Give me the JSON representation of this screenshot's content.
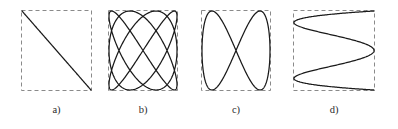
{
  "figure": {
    "title": "",
    "background_color": "#ffffff",
    "curve_color": "#1a1a1a",
    "box_color": "#8a8a8a",
    "label_color": "#2b2b2b",
    "panel_count": 4
  },
  "chart_data": {
    "type": "line",
    "xlabel": "",
    "ylabel": "",
    "grid": false,
    "legend": null,
    "panels": [
      {
        "id": "a",
        "label": "a)",
        "description": "straight diagonal line from top-left to bottom-right",
        "frequency_ratio": "1:1",
        "phase_deg": 180,
        "lobes_horizontal": 1,
        "lobes_vertical": 1,
        "box": {
          "x": 21,
          "y": 10,
          "width": 71,
          "height": 81
        },
        "xlim": [
          -1,
          1
        ],
        "ylim": [
          -1,
          1
        ],
        "param": {
          "a": 1,
          "b": 1,
          "delta_deg": 180,
          "t_range_deg": [
            0,
            360
          ]
        },
        "samples": 400
      },
      {
        "id": "b",
        "label": "b)",
        "description": "woven X-pattern with three rounded lobes on each vertical side",
        "frequency_ratio": "3:4",
        "phase_deg": 90,
        "lobes_horizontal": 4,
        "lobes_vertical": 3,
        "box": {
          "x": 108,
          "y": 10,
          "width": 70,
          "height": 81
        },
        "xlim": [
          -1,
          1
        ],
        "ylim": [
          -1,
          1
        ],
        "param": {
          "a": 3,
          "b": 4,
          "delta_deg": 90,
          "t_range_deg": [
            0,
            360
          ]
        },
        "samples": 800
      },
      {
        "id": "c",
        "label": "c)",
        "description": "two elongated loops crossing once at center, sideways Z shape",
        "frequency_ratio": "1:2",
        "phase_deg": 90,
        "lobes_horizontal": 2,
        "lobes_vertical": 1,
        "box": {
          "x": 201,
          "y": 10,
          "width": 70,
          "height": 81
        },
        "xlim": [
          -1,
          1
        ],
        "ylim": [
          -1,
          1
        ],
        "param": {
          "a": 1,
          "b": 2,
          "delta_deg": 90,
          "t_range_deg": [
            0,
            360
          ]
        },
        "samples": 600
      },
      {
        "id": "d",
        "label": "d)",
        "description": "four tall narrow vertical ellipse lobes side by side",
        "frequency_ratio": "1:4",
        "phase_deg": 90,
        "lobes_horizontal": 4,
        "lobes_vertical": 1,
        "box": {
          "x": 293,
          "y": 10,
          "width": 82,
          "height": 81
        },
        "xlim": [
          -1,
          1
        ],
        "ylim": [
          -1,
          1
        ],
        "param": {
          "a": 4,
          "b": 1,
          "delta_deg": 90,
          "t_range_deg": [
            0,
            360
          ]
        },
        "samples": 800
      }
    ]
  }
}
